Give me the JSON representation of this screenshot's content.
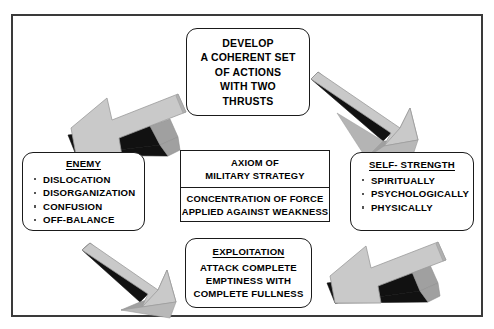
{
  "diagram": {
    "title_visible": false,
    "frame": {
      "border_color": "#3a3a3a"
    },
    "arrow_colors": {
      "top_face": "#c9c9c9",
      "side_face": "#a0a0a0",
      "shadow_face": "#111111",
      "outline": "#8a8a8a"
    },
    "nodes": {
      "develop": {
        "name": "develop-box",
        "shape": "rounded-rectangle",
        "lines": [
          "DEVELOP",
          "A COHERENT SET",
          "OF ACTIONS",
          "WITH TWO",
          "THRUSTS"
        ]
      },
      "enemy": {
        "name": "enemy-box",
        "shape": "rounded-rectangle",
        "title": "ENEMY",
        "items": [
          "DISLOCATION",
          "DISORGANIZATION",
          "CONFUSION",
          "OFF-BALANCE"
        ]
      },
      "self_strength": {
        "name": "self-strength-box",
        "shape": "rounded-rectangle",
        "title": "SELF- STRENGTH",
        "items": [
          "SPIRITUALLY",
          "PSYCHOLOGICALLY",
          "PHYSICALLY"
        ]
      },
      "axiom": {
        "name": "axiom-box",
        "shape": "rectangle",
        "header_lines": [
          "AXIOM  OF",
          "MILITARY STRATEGY"
        ],
        "body_lines": [
          "CONCENTRATION OF FORCE",
          "APPLIED AGAINST WEAKNESS"
        ]
      },
      "exploitation": {
        "name": "exploitation-box",
        "shape": "rounded-rectangle",
        "title": "EXPLOITATION",
        "body_lines": [
          "ATTACK COMPLETE",
          "EMPTINESS WITH",
          "COMPLETE FULLNESS"
        ]
      }
    },
    "arrows": [
      {
        "name": "arrow-develop-to-enemy",
        "direction": "down-left",
        "from": "develop",
        "to": "enemy"
      },
      {
        "name": "arrow-develop-to-self-strength",
        "direction": "down-right",
        "from": "develop",
        "to": "self_strength"
      },
      {
        "name": "arrow-enemy-to-exploitation",
        "direction": "down-right",
        "from": "enemy",
        "to": "exploitation"
      },
      {
        "name": "arrow-self-strength-to-exploitation",
        "direction": "down-left",
        "from": "self_strength",
        "to": "exploitation"
      }
    ]
  }
}
